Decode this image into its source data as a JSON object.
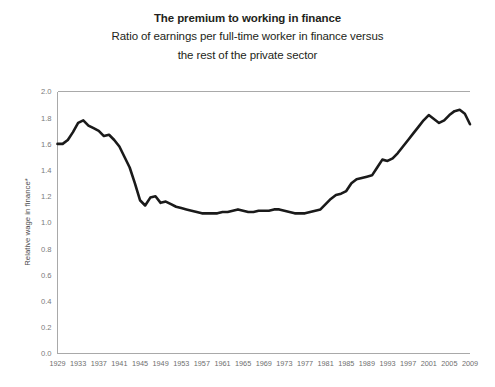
{
  "chart_data": {
    "type": "line",
    "title": "The premium to working in finance",
    "subtitle_line1": "Ratio of earnings per full-time worker in finance versus",
    "subtitle_line2": "the rest of the private sector",
    "xlabel": "",
    "ylabel": "Relative wage in finance*",
    "ylim": [
      0.0,
      2.0
    ],
    "xlim": [
      1929,
      2009
    ],
    "grid": false,
    "legend": null,
    "ytick_labels": [
      "0.0",
      "0.2",
      "0.4",
      "0.6",
      "0.8",
      "1.0",
      "1.2",
      "1.4",
      "1.6",
      "1.8",
      "2.0"
    ],
    "ytick_values": [
      0.0,
      0.2,
      0.4,
      0.6,
      0.8,
      1.0,
      1.2,
      1.4,
      1.6,
      1.8,
      2.0
    ],
    "xtick_labels": [
      "1929",
      "1933",
      "1937",
      "1941",
      "1945",
      "1949",
      "1953",
      "1957",
      "1961",
      "1965",
      "1969",
      "1973",
      "1977",
      "1981",
      "1985",
      "1989",
      "1993",
      "1997",
      "2001",
      "2005",
      "2009"
    ],
    "xtick_values": [
      1929,
      1933,
      1937,
      1941,
      1945,
      1949,
      1953,
      1957,
      1961,
      1965,
      1969,
      1973,
      1977,
      1981,
      1985,
      1989,
      1993,
      1997,
      2001,
      2005,
      2009
    ],
    "series": [
      {
        "name": "Relative wage in finance",
        "color": "#1a1a1a",
        "x": [
          1929,
          1930,
          1931,
          1932,
          1933,
          1934,
          1935,
          1936,
          1937,
          1938,
          1939,
          1940,
          1941,
          1942,
          1943,
          1944,
          1945,
          1946,
          1947,
          1948,
          1949,
          1950,
          1951,
          1952,
          1953,
          1954,
          1955,
          1956,
          1957,
          1958,
          1959,
          1960,
          1961,
          1962,
          1963,
          1964,
          1965,
          1966,
          1967,
          1968,
          1969,
          1970,
          1971,
          1972,
          1973,
          1974,
          1975,
          1976,
          1977,
          1978,
          1979,
          1980,
          1981,
          1982,
          1983,
          1984,
          1985,
          1986,
          1987,
          1988,
          1989,
          1990,
          1991,
          1992,
          1993,
          1994,
          1995,
          1996,
          1997,
          1998,
          1999,
          2000,
          2001,
          2002,
          2003,
          2004,
          2005,
          2006,
          2007,
          2008,
          2009
        ],
        "values": [
          1.6,
          1.6,
          1.63,
          1.69,
          1.76,
          1.78,
          1.74,
          1.72,
          1.7,
          1.66,
          1.67,
          1.63,
          1.58,
          1.5,
          1.42,
          1.3,
          1.17,
          1.13,
          1.19,
          1.2,
          1.15,
          1.16,
          1.14,
          1.12,
          1.11,
          1.1,
          1.09,
          1.08,
          1.07,
          1.07,
          1.07,
          1.07,
          1.08,
          1.08,
          1.09,
          1.1,
          1.09,
          1.08,
          1.08,
          1.09,
          1.09,
          1.09,
          1.1,
          1.1,
          1.09,
          1.08,
          1.07,
          1.07,
          1.07,
          1.08,
          1.09,
          1.1,
          1.14,
          1.18,
          1.21,
          1.22,
          1.24,
          1.3,
          1.33,
          1.34,
          1.35,
          1.36,
          1.42,
          1.48,
          1.47,
          1.49,
          1.53,
          1.58,
          1.63,
          1.68,
          1.73,
          1.78,
          1.82,
          1.79,
          1.76,
          1.78,
          1.82,
          1.85,
          1.86,
          1.83,
          1.75
        ]
      }
    ]
  },
  "footnote": "*"
}
